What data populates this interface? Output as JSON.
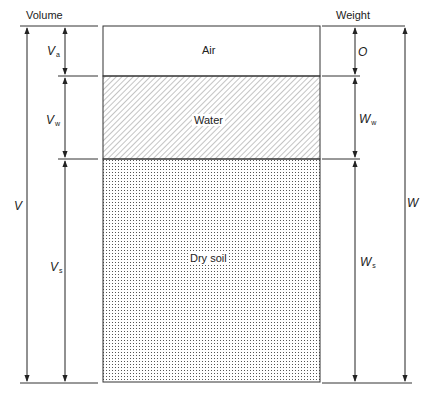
{
  "headers": {
    "volume": "Volume",
    "weight": "Weight"
  },
  "phases": [
    {
      "name": "Air",
      "fill": "blank"
    },
    {
      "name": "Water",
      "fill": "hatched"
    },
    {
      "name": "Dry soil",
      "fill": "dotted"
    }
  ],
  "volume_labels": {
    "total": {
      "main": "V",
      "sub": ""
    },
    "air": {
      "main": "V",
      "sub": "a"
    },
    "water": {
      "main": "V",
      "sub": "w"
    },
    "solid": {
      "main": "V",
      "sub": "s"
    }
  },
  "weight_labels": {
    "total": {
      "main": "W",
      "sub": ""
    },
    "air": {
      "main": "O",
      "sub": ""
    },
    "water": {
      "main": "W",
      "sub": "w"
    },
    "solid": {
      "main": "W",
      "sub": "s"
    }
  }
}
